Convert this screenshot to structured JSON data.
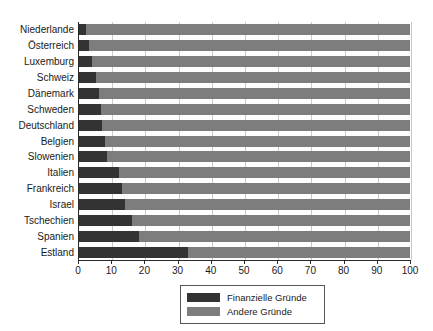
{
  "chart_data": {
    "type": "bar",
    "orientation": "horizontal",
    "stacked": true,
    "title": "",
    "subtitle": "",
    "xlabel": "",
    "ylabel": "",
    "xlim": [
      0,
      100
    ],
    "xticks": [
      0,
      10,
      20,
      30,
      40,
      50,
      60,
      70,
      80,
      90,
      100
    ],
    "xtick_labels": [
      "0",
      "10",
      "20",
      "30",
      "40",
      "50",
      "60",
      "70",
      "80",
      "90",
      "100"
    ],
    "grid": "vertical",
    "legend_position": "bottom-center",
    "categories": [
      "Niederlande",
      "Österreich",
      "Luxemburg",
      "Schweiz",
      "Dänemark",
      "Schweden",
      "Deutschland",
      "Belgien",
      "Slowenien",
      "Italien",
      "Frankreich",
      "Israel",
      "Tschechien",
      "Spanien",
      "Estland"
    ],
    "series": [
      {
        "name": "Finanzielle Gründe",
        "color": "#333333",
        "values": [
          2,
          3,
          4,
          5,
          6,
          6.5,
          7,
          8,
          8.5,
          12,
          13,
          14,
          16,
          18,
          33
        ]
      },
      {
        "name": "Andere Gründe",
        "color": "#7d7d7d",
        "values": [
          98,
          97,
          96,
          95,
          94,
          93.5,
          93,
          92,
          91.5,
          88,
          87,
          86,
          84,
          82,
          67
        ]
      }
    ]
  },
  "legend": {
    "items": [
      {
        "label": "Finanzielle Gründe",
        "color": "#333333"
      },
      {
        "label": "Andere Gründe",
        "color": "#7d7d7d"
      }
    ]
  },
  "colors": {
    "dark_segment": "#333333",
    "light_segment": "#7d7d7d",
    "gridline": "#c9c9c9",
    "axis": "#2a2a2a",
    "background": "#ffffff"
  }
}
